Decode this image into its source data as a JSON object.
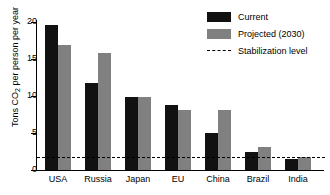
{
  "chart_data": {
    "type": "bar",
    "title": "",
    "xlabel": "",
    "ylabel": "Tons CO2 per person per year",
    "ylabel_prefix": "Tons CO",
    "ylabel_sub": "2",
    "ylabel_suffix": " per person per year",
    "categories": [
      "USA",
      "Russia",
      "Japan",
      "EU",
      "China",
      "Brazil",
      "India"
    ],
    "series": [
      {
        "name": "Current",
        "color": "#111111",
        "values": [
          19.6,
          11.7,
          9.9,
          8.8,
          5.0,
          2.4,
          1.5
        ]
      },
      {
        "name": "Projected (2030)",
        "color": "#808080",
        "values": [
          16.9,
          15.8,
          9.9,
          8.1,
          8.1,
          3.1,
          1.7
        ]
      }
    ],
    "reference_line": {
      "name": "Stabilization level",
      "value": 1.8,
      "style": "dashed",
      "color": "#000000"
    },
    "ylim": [
      0,
      20
    ],
    "yticks": [
      0,
      5,
      10,
      15,
      20
    ],
    "ytick_labels": [
      "0",
      "5",
      "10",
      "15",
      "20"
    ],
    "grid": false,
    "legend_position": "top-right"
  },
  "legend": {
    "items": [
      {
        "label": "Current",
        "swatch": "current"
      },
      {
        "label": "Projected (2030)",
        "swatch": "projected"
      },
      {
        "label": "Stabilization level",
        "swatch": "dashline"
      }
    ]
  }
}
